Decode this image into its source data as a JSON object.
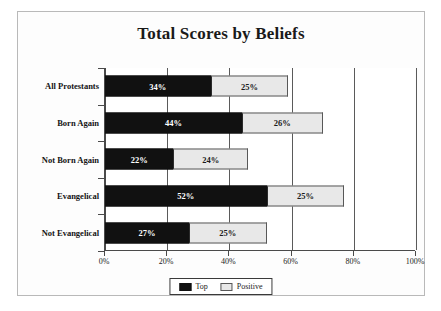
{
  "chart_data": {
    "type": "bar",
    "orientation": "horizontal",
    "stacked": true,
    "title": "Total Scores by Beliefs",
    "xlabel": "",
    "ylabel": "",
    "xlim": [
      0,
      100
    ],
    "xticks": [
      0,
      20,
      40,
      60,
      80,
      100
    ],
    "xtick_labels": [
      "0%",
      "20%",
      "40%",
      "60%",
      "80%",
      "100%"
    ],
    "grid": true,
    "grid_axis": "x",
    "legend_position": "bottom-center",
    "categories": [
      "All Protestants",
      "Born Again",
      "Not Born Again",
      "Evangelical",
      "Not Evangelical"
    ],
    "series": [
      {
        "name": "Top",
        "color": "#111111",
        "values": [
          34,
          44,
          22,
          52,
          27
        ],
        "value_labels": [
          "34%",
          "44%",
          "22%",
          "52%",
          "27%"
        ]
      },
      {
        "name": "Positive",
        "color": "#e8e8e8",
        "values": [
          25,
          26,
          24,
          25,
          25
        ],
        "value_labels": [
          "25%",
          "26%",
          "24%",
          "25%",
          "25%"
        ]
      }
    ],
    "totals": [
      59,
      70,
      46,
      77,
      52
    ]
  },
  "legend": {
    "items": [
      {
        "label": "Top",
        "swatch": "black-swatch-icon"
      },
      {
        "label": "Positive",
        "swatch": "light-gray-swatch-icon"
      }
    ]
  }
}
